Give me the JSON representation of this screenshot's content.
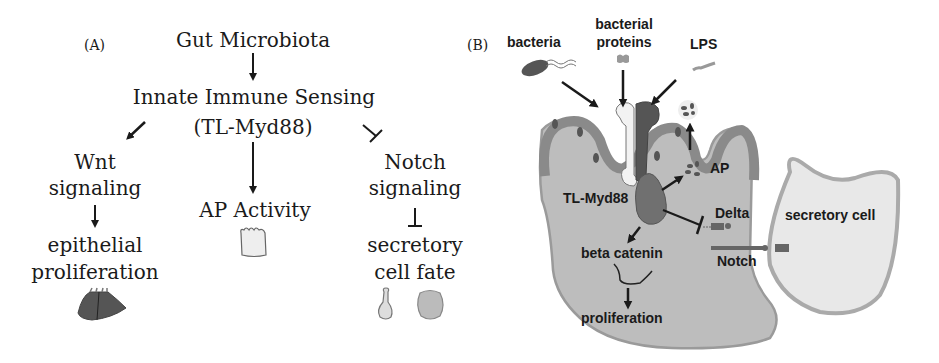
{
  "panelA": {
    "label": "(A)",
    "top": "Gut Microbiota",
    "sensing_line1": "Innate Immune Sensing",
    "sensing_line2": "(TL-Myd88)",
    "left_branch": {
      "line1": "Wnt",
      "line2": "signaling",
      "out1": "epithelial",
      "out2": "proliferation",
      "relation": "activates",
      "icon": "proliferating-epithelium-icon"
    },
    "middle_branch": {
      "label": "AP Activity",
      "relation": "activates",
      "icon": "enterocyte-icon"
    },
    "right_branch": {
      "line1": "Notch",
      "line2": "signaling",
      "out1": "secretory",
      "out2": "cell fate",
      "relation": "inhibits",
      "icons": [
        "goblet-cell-icon",
        "enteroendocrine-cell-icon"
      ]
    }
  },
  "panelB": {
    "label": "(B)",
    "inputs": [
      "bacteria",
      "bacterial",
      "proteins",
      "LPS"
    ],
    "receptor": "TL-Myd88",
    "ap": "AP",
    "delta": "Delta",
    "notch": "Notch",
    "beta_catenin": "beta catenin",
    "proliferation": "proliferation",
    "secretory_cell": "secretory cell"
  },
  "colors": {
    "text": "#1a1a1a",
    "cell_fill": "#bdbdbd",
    "cell_border": "#9a9a9a",
    "brush_border": "#8a8a8a",
    "dark_protein": "#5a5a5a",
    "secretory_fill": "#e6e6e6",
    "secretory_border": "#a8a8a8"
  }
}
